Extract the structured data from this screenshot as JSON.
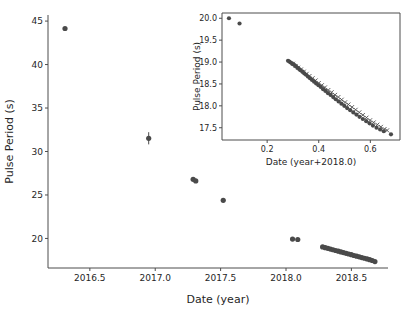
{
  "figure": {
    "background_color": "#ffffff",
    "marker_color": "#4a4a4a",
    "axis_color": "#4d4d4d"
  },
  "chart_data": [
    {
      "id": "main",
      "type": "scatter",
      "title": "",
      "xlabel": "Date (year)",
      "ylabel": "Pulse Period (s)",
      "xlim": [
        2016.18,
        2018.78
      ],
      "ylim": [
        16.6,
        45.7
      ],
      "xticks": [
        2016.5,
        2017.0,
        2017.5,
        2018.0,
        2018.5
      ],
      "xticklabels": [
        "2016.5",
        "2017.0",
        "2017.5",
        "2018.0",
        "2018.5"
      ],
      "yticks": [
        20,
        25,
        30,
        35,
        40,
        45
      ],
      "yticklabels": [
        "20",
        "25",
        "30",
        "35",
        "40",
        "45"
      ],
      "grid": false,
      "legend": "none",
      "marker": "circle",
      "series": [
        {
          "name": "Pulse period",
          "x": [
            2016.31,
            2016.95,
            2017.29,
            2017.31,
            2017.52,
            2018.05,
            2018.09,
            2018.28,
            2018.3,
            2018.32,
            2018.34,
            2018.36,
            2018.38,
            2018.4,
            2018.42,
            2018.44,
            2018.46,
            2018.48,
            2018.5,
            2018.52,
            2018.54,
            2018.56,
            2018.58,
            2018.6,
            2018.62,
            2018.64,
            2018.66,
            2018.68
          ],
          "y": [
            44.15,
            31.52,
            26.8,
            26.62,
            24.38,
            19.93,
            19.88,
            19.02,
            18.94,
            18.86,
            18.78,
            18.7,
            18.61,
            18.53,
            18.45,
            18.37,
            18.29,
            18.21,
            18.13,
            18.04,
            17.96,
            17.88,
            17.8,
            17.72,
            17.64,
            17.56,
            17.46,
            17.34
          ],
          "yerr_point": {
            "x": 2016.95,
            "y": 31.52,
            "err": 0.7
          }
        }
      ]
    },
    {
      "id": "inset",
      "type": "scatter",
      "title": "",
      "xlabel": "Date (year+2018.0)",
      "ylabel": "Pulse Period (s)",
      "xlim": [
        0.025,
        0.715
      ],
      "ylim": [
        17.22,
        20.12
      ],
      "xticks": [
        0.2,
        0.4,
        0.6
      ],
      "xticklabels": [
        "0.2",
        "0.4",
        "0.6"
      ],
      "yticks": [
        17.5,
        18.0,
        18.5,
        19.0,
        19.5,
        20.0
      ],
      "yticklabels": [
        "17.5",
        "18.0",
        "18.5",
        "19.0",
        "19.5",
        "20.0"
      ],
      "grid": false,
      "legend": "none",
      "markers": [
        "circle",
        "x"
      ],
      "series": [
        {
          "name": "Pulse period (circles)",
          "marker": "circle",
          "x": [
            0.052,
            0.093,
            0.281,
            0.286,
            0.291,
            0.296,
            0.301,
            0.306,
            0.312,
            0.318,
            0.324,
            0.33,
            0.337,
            0.344,
            0.351,
            0.358,
            0.366,
            0.374,
            0.382,
            0.39,
            0.399,
            0.408,
            0.417,
            0.426,
            0.436,
            0.446,
            0.456,
            0.466,
            0.477,
            0.488,
            0.499,
            0.51,
            0.522,
            0.534,
            0.546,
            0.558,
            0.571,
            0.584,
            0.597,
            0.61,
            0.624,
            0.638,
            0.652,
            0.68
          ],
          "y": [
            20.0,
            19.88,
            19.03,
            19.01,
            18.99,
            18.97,
            18.95,
            18.93,
            18.9,
            18.87,
            18.84,
            18.81,
            18.78,
            18.74,
            18.71,
            18.67,
            18.63,
            18.59,
            18.55,
            18.51,
            18.47,
            18.43,
            18.38,
            18.34,
            18.29,
            18.25,
            18.2,
            18.15,
            18.1,
            18.05,
            18.0,
            17.95,
            17.9,
            17.85,
            17.8,
            17.75,
            17.7,
            17.65,
            17.6,
            17.55,
            17.5,
            17.46,
            17.42,
            17.35
          ]
        },
        {
          "name": "Pulse period (crosses)",
          "marker": "x",
          "x": [
            0.3,
            0.31,
            0.32,
            0.331,
            0.342,
            0.353,
            0.364,
            0.376,
            0.388,
            0.4,
            0.412,
            0.424,
            0.437,
            0.45,
            0.463,
            0.476,
            0.489,
            0.502,
            0.515,
            0.529,
            0.543,
            0.557,
            0.571,
            0.585,
            0.599,
            0.613,
            0.627,
            0.641,
            0.655,
            0.665
          ],
          "y": [
            18.96,
            18.91,
            18.87,
            18.83,
            18.78,
            18.73,
            18.68,
            18.63,
            18.58,
            18.52,
            18.47,
            18.42,
            18.36,
            18.31,
            18.25,
            18.2,
            18.14,
            18.08,
            18.03,
            17.97,
            17.91,
            17.85,
            17.79,
            17.73,
            17.67,
            17.62,
            17.57,
            17.52,
            17.47,
            17.44
          ]
        }
      ]
    }
  ]
}
